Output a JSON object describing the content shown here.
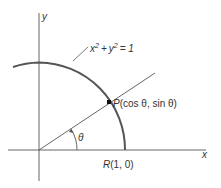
{
  "figure": {
    "axis_x_label": "x",
    "axis_y_label": "y",
    "circle_equation": {
      "x": "x",
      "y": "y",
      "exp": "2",
      "plus": "+",
      "rhs": "= 1"
    },
    "point_p": {
      "name": "P",
      "coords": "(cos θ, sin θ)"
    },
    "point_r": {
      "name": "R",
      "coords": "(1, 0)"
    },
    "angle_label": "θ",
    "colors": {
      "stroke": "#444444",
      "arc": "#555555"
    }
  }
}
